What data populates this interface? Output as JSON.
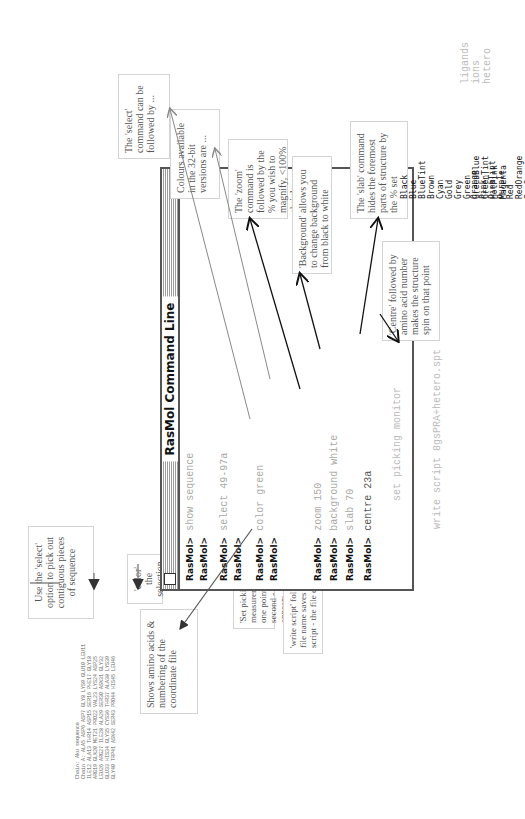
{
  "window": {
    "title": "RasMol Command Line",
    "prompt": "RasMol>",
    "lines": [
      {
        "prompt": "RasMol>",
        "command": "show sequence"
      },
      {
        "prompt": "RasMol>",
        "command": ""
      },
      {
        "prompt": "RasMol>",
        "command": "select 49-97a"
      },
      {
        "prompt": "RasMol>",
        "command": ""
      },
      {
        "prompt": "RasMol>",
        "command": "color green"
      },
      {
        "prompt": "RasMol>",
        "command": ""
      },
      {
        "prompt": "RasMol>",
        "command": "zoom 150"
      },
      {
        "prompt": "RasMol>",
        "command": "background white"
      },
      {
        "prompt": "RasMol>",
        "command": "slab 70"
      },
      {
        "prompt": "RasMol>",
        "command": "centre 23a"
      }
    ],
    "outside_commands": [
      "set picking monitor",
      "write script 8gsPRA+hetero.spt"
    ]
  },
  "sequence_dump": {
    "header": "Chain: Aku sequence",
    "rows": [
      "Chain A: ALA5 ASP6 ASP7 GLY8 LYS9 GLU10 LEU11",
      "ILE12 ALA13 THR14 ASP15 SER16 PHE17 GLY18",
      "ARG19 GLN20 MET21 PRO22 VAL23 LYS24 ASP25",
      "LEU26 ARG27 ILE28 ALA29 SER30 ASN31 GLY32",
      "GLU33 HIS34 GLY35 CYS36 THR37 ALA38 LYS39",
      "GLY40 TRP41 ASN42 SER43 PRO44 HIS45 LEU46"
    ]
  },
  "colours": {
    "col1": [
      "Black",
      "Blue",
      "BlueTint",
      "Brown",
      "Cyan",
      "Gold",
      "Grey",
      "Green",
      "GreenBlue",
      "GreenTint",
      "HotPink",
      "Magenta"
    ],
    "col2": [
      "Orange",
      "Pink",
      "PinkTint",
      "Purple",
      "Red",
      "RedOrange",
      "SeaGreen",
      "SkyBlue",
      "Violet",
      "White",
      "Yellow",
      "YellowTint"
    ]
  },
  "select_keywords": [
    "ligands",
    "ions",
    "hetero"
  ],
  "annotations": {
    "sequence": "Shows amino acids & numbering of the coordinate file",
    "select_followed": "The 'select' command can be followed by ...",
    "colours_available": "Colours available in the 32-bit versions are ...",
    "zoom": "The 'zoom' command is followed by the % you wish to magnify, <100% shrinks.",
    "background": "'Background' allows you to change background from black to white",
    "slab": "The 'slab' command hides the foremost parts of structure by the % set",
    "centre": "'Centre' followed by amino acid number makes the structure spin on that point",
    "select_use": "Use the 'select' option to pick out contiguous pieces of sequence",
    "color_sel": "'color' the selection",
    "picking": "'Set picking monitor' turns on measurement mode - click on one point on structure then an second - a line with distance appears",
    "write_script": "'write script' followed by your chosen file name saves the modifications as a script - the file extension is 'spt'"
  },
  "colors": {
    "window_border": "#555555",
    "annotation_text": "#555555",
    "box_border": "#d4d4d4",
    "command_text": "#aaaaaa",
    "arrow_dark": "#111111",
    "arrow_grey": "#888888"
  }
}
